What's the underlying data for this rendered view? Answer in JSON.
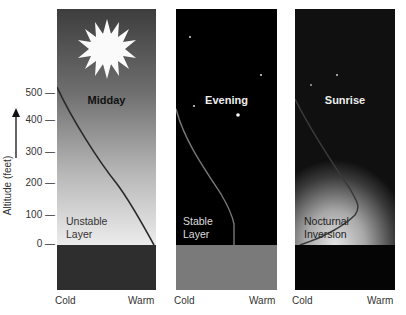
{
  "figure": {
    "y_axis": {
      "label": "Altitude (feet)",
      "ticks": [
        "500",
        "400",
        "300",
        "200",
        "100",
        "0"
      ],
      "arrow": "up-arrow"
    },
    "panels": [
      {
        "title": "Midday",
        "layer_label_1": "Unstable",
        "layer_label_2": "Layer",
        "icon": "sun-icon",
        "x_min_label": "Cold",
        "x_max_label": "Warm",
        "sky_colors": [
          "#3a3a3a",
          "#e8e8e8"
        ],
        "ground_color": "#2e2e2e"
      },
      {
        "title": "Evening",
        "layer_label_1": "Stable",
        "layer_label_2": "Layer",
        "icon": "crescent-moon-icon",
        "x_min_label": "Cold",
        "x_max_label": "Warm",
        "sky_colors": [
          "#000000",
          "#000000"
        ],
        "ground_color": "#7a7a7a"
      },
      {
        "title": "Sunrise",
        "layer_label_1": "Nocturnal",
        "layer_label_2": "Inversion",
        "icon": "stars-icon",
        "x_min_label": "Cold",
        "x_max_label": "Warm",
        "sky_colors": [
          "#000000",
          "#d8d8d8"
        ],
        "ground_color": "#050505"
      }
    ]
  }
}
